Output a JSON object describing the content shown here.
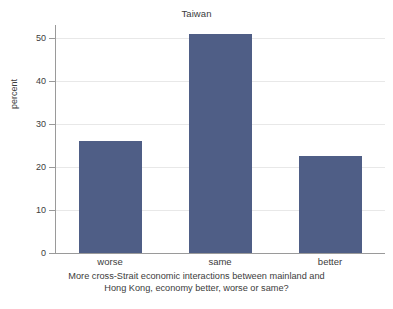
{
  "chart_data": {
    "type": "bar",
    "title": "Taiwan",
    "categories": [
      "worse",
      "same",
      "better"
    ],
    "values": [
      26.0,
      51.0,
      22.6
    ],
    "xlabel": "More cross-Strait economic interactions between mainland and Hong Kong, economy better, worse or same?",
    "xlabel_lines": [
      "More cross-Strait economic interactions between mainland and",
      "Hong Kong, economy better, worse or same?"
    ],
    "ylabel": "percent",
    "ylim": [
      0,
      53
    ],
    "yticks": [
      0,
      10,
      20,
      30,
      40,
      50
    ],
    "ytick_labels": [
      "0",
      "10",
      "20",
      "30",
      "40",
      "50"
    ],
    "grid": true,
    "legend": false,
    "bar_color": "#4f5e86",
    "grid_color": "#e8e8e8",
    "axis_color": "#9a9a9a",
    "background_color": "#ffffff"
  }
}
